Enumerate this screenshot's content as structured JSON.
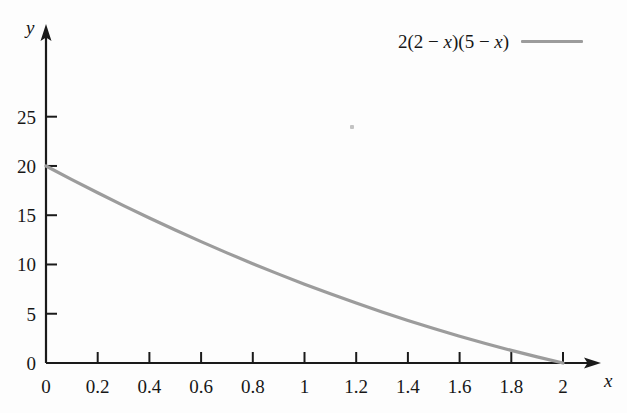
{
  "chart_data": {
    "type": "line",
    "title": "",
    "subtitle": "",
    "xlabel": "x",
    "ylabel": "y",
    "xlim": [
      0,
      2
    ],
    "ylim": [
      0,
      26
    ],
    "grid": false,
    "legend_position": "top-right",
    "legend": [
      {
        "name": "2(2 − x)(5 − x)",
        "color": "#9c9c9c"
      }
    ],
    "x_ticks": [
      0,
      0.2,
      0.4,
      0.6,
      0.8,
      1,
      1.2,
      1.4,
      1.6,
      1.8,
      2
    ],
    "x_tick_labels": [
      "0",
      "0.2",
      "0.4",
      "0.6",
      "0.8",
      "1",
      "1.2",
      "1.4",
      "1.6",
      "1.8",
      "2"
    ],
    "y_ticks": [
      0,
      5,
      10,
      15,
      20,
      25
    ],
    "y_tick_labels": [
      "0",
      "5",
      "10",
      "15",
      "20",
      "25"
    ],
    "series": [
      {
        "name": "2(2 − x)(5 − x)",
        "color": "#9c9c9c",
        "x": [
          0,
          0.1,
          0.2,
          0.3,
          0.4,
          0.5,
          0.6,
          0.7,
          0.8,
          0.9,
          1,
          1.1,
          1.2,
          1.3,
          1.4,
          1.5,
          1.6,
          1.7,
          1.8,
          1.9,
          2
        ],
        "values": [
          20,
          18.62,
          17.28,
          15.98,
          14.72,
          13.5,
          12.32,
          11.18,
          10.08,
          9.02,
          8,
          7.02,
          6.08,
          5.18,
          4.32,
          3.5,
          2.72,
          1.98,
          1.28,
          0.62,
          0
        ]
      }
    ]
  },
  "axis": {
    "x_name": "x",
    "y_name": "y"
  },
  "legend_text": {
    "prefix": "2(2 − ",
    "var1": "x",
    "middle": ")(5 − ",
    "var2": "x",
    "suffix": ")"
  }
}
